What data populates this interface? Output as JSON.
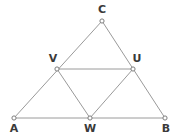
{
  "figure": {
    "canvas": {
      "width": 174,
      "height": 137
    },
    "background_color": "#ffffff",
    "line_color": "#9a9a9a",
    "marker_fill_color": "#ffffff",
    "marker_stroke_color": "#7d7d7d",
    "label_color": "#3a3a3a",
    "points": [
      {
        "id": "A",
        "label": "A",
        "x": 14,
        "y": 118,
        "label_x": 14,
        "label_y": 132
      },
      {
        "id": "B",
        "label": "B",
        "x": 165,
        "y": 118,
        "label_x": 166,
        "label_y": 132
      },
      {
        "id": "C",
        "label": "C",
        "x": 102,
        "y": 21,
        "label_x": 102,
        "label_y": 13
      },
      {
        "id": "V",
        "label": "V",
        "x": 57,
        "y": 69,
        "label_x": 53,
        "label_y": 62
      },
      {
        "id": "U",
        "label": "U",
        "x": 133,
        "y": 69,
        "label_x": 137,
        "label_y": 62
      },
      {
        "id": "W",
        "label": "W",
        "x": 90,
        "y": 118,
        "label_x": 90,
        "label_y": 132
      }
    ],
    "segments": [
      {
        "id": "AB",
        "from": "A",
        "to": "B"
      },
      {
        "id": "AC",
        "from": "A",
        "to": "C"
      },
      {
        "id": "BC",
        "from": "B",
        "to": "C"
      },
      {
        "id": "VU",
        "from": "V",
        "to": "U"
      },
      {
        "id": "VW",
        "from": "V",
        "to": "W"
      },
      {
        "id": "UW",
        "from": "U",
        "to": "W"
      }
    ]
  }
}
